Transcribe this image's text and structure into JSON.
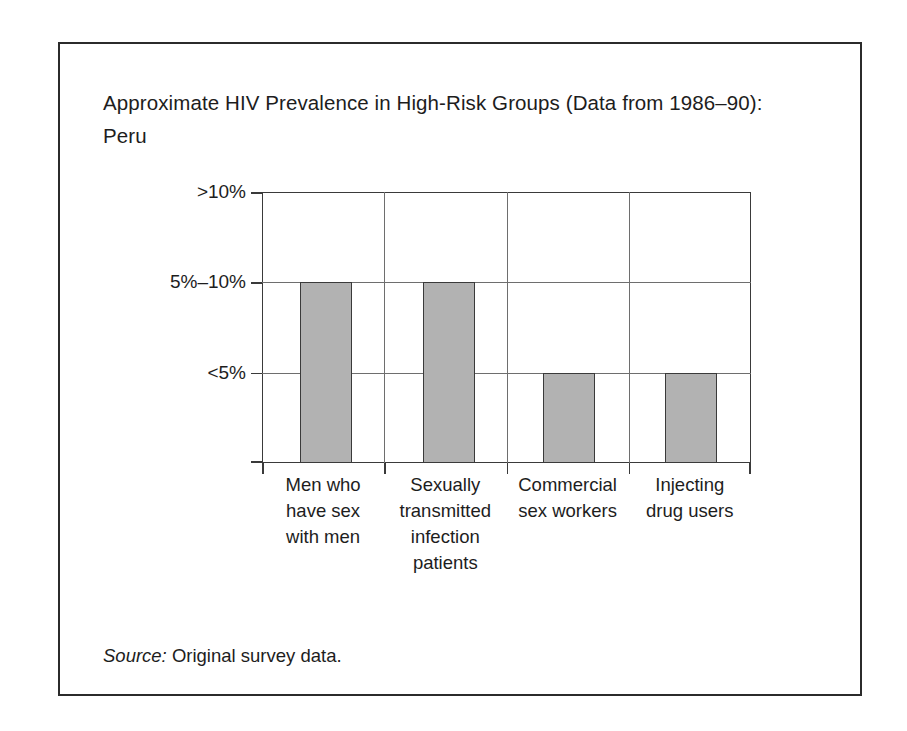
{
  "figure": {
    "title": "Approximate HIV Prevalence in High-Risk Groups (Data from 1986–90): Peru",
    "source_label": "Source:",
    "source_text": "Original survey data."
  },
  "colors": {
    "bar_fill": "#b2b2b2",
    "bar_stroke": "#3a3a3a",
    "axis": "#3a3a3a",
    "gridline": "#6e6e6e",
    "top_rule": "#111111",
    "text": "#1d1d1d"
  },
  "chart_data": {
    "type": "bar",
    "title": "Approximate HIV Prevalence in High-Risk Groups (Data from 1986–90): Peru",
    "xlabel": "",
    "ylabel": "",
    "categories": [
      "Men who have sex with men",
      "Sexually transmitted infection patients",
      "Commercial sex workers",
      "Injecting drug users"
    ],
    "category_lines": [
      [
        "Men who",
        "have sex",
        "with men"
      ],
      [
        "Sexually",
        "transmitted",
        "infection",
        "patients"
      ],
      [
        "Commercial",
        "sex workers"
      ],
      [
        "Injecting",
        "drug users"
      ]
    ],
    "values": [
      "5%–10%",
      "5%–10%",
      "<5%",
      "<5%"
    ],
    "value_levels": [
      2,
      2,
      1,
      1
    ],
    "ytick_labels": [
      "<5%",
      "5%–10%",
      ">10%"
    ],
    "ytick_levels": [
      1,
      2,
      3
    ],
    "ylim": [
      0,
      3
    ],
    "grid": true,
    "legend": "none"
  }
}
